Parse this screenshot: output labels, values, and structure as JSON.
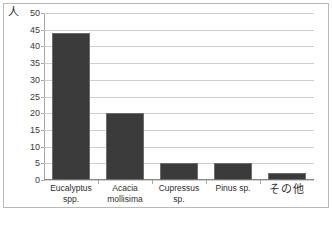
{
  "chart_data": {
    "type": "bar",
    "title": "",
    "subtitle": "",
    "xlabel": "",
    "ylabel": "人",
    "ylim": [
      0,
      50
    ],
    "ytick_step": 5,
    "yticks": [
      0,
      5,
      10,
      15,
      20,
      25,
      30,
      35,
      40,
      45,
      50
    ],
    "ytick_labels": [
      "0",
      "5",
      "10",
      "15",
      "20",
      "25",
      "30",
      "35",
      "40",
      "45",
      "50"
    ],
    "grid": true,
    "grid_axis": "y",
    "legend": false,
    "legend_position": "none",
    "categories": [
      "Eucalyptus spp.",
      "Acacia mollisima",
      "Cupressus sp.",
      "Pinus sp.",
      "その他"
    ],
    "category_lines": [
      [
        "Eucalyptus",
        "spp."
      ],
      [
        "Acacia",
        "mollisima"
      ],
      [
        "Cupressus",
        "sp."
      ],
      [
        "Pinus sp."
      ],
      [
        "その他"
      ]
    ],
    "values": [
      44,
      20,
      5,
      5,
      2
    ],
    "bar_color": "#3b3b3b",
    "bar_edge_color": "#6d6d6d",
    "grid_color": "#cfcfcf",
    "axis_color": "#a8a8a8",
    "frame_color": "#b9b9b9",
    "background_color": "#ffffff"
  }
}
